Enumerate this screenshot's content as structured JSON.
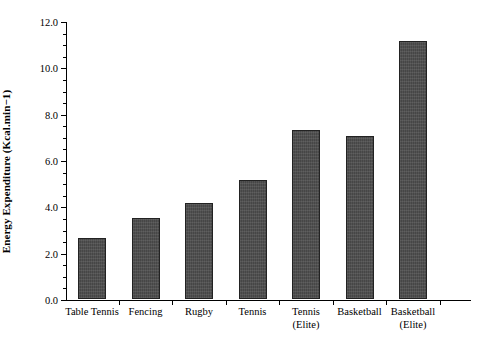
{
  "chart_data": {
    "type": "bar",
    "title": "",
    "xlabel": "",
    "ylabel": "Energy Expenditure (Kcal.min−1)",
    "categories": [
      "Table Tennis",
      "Fencing",
      "Rugby",
      "Tennis",
      "Tennis\n(Elite)",
      "Basketball",
      "Basketball\n(Elite)"
    ],
    "values": [
      2.63,
      3.5,
      4.15,
      5.15,
      7.3,
      7.05,
      11.15
    ],
    "ylim": [
      0.0,
      12.0
    ],
    "ytick_labels": [
      "0.0",
      "2.0",
      "4.0",
      "6.0",
      "8.0",
      "10.0",
      "12.0"
    ],
    "ytick_values": [
      0.0,
      2.0,
      4.0,
      6.0,
      8.0,
      10.0,
      12.0
    ],
    "yminor_step": 0.5,
    "grid": false,
    "legend": null,
    "bar_color": "#4d4d4d",
    "bar_edge_color": "#222222",
    "background_color": "#ffffff",
    "axis_color": "#000000"
  }
}
